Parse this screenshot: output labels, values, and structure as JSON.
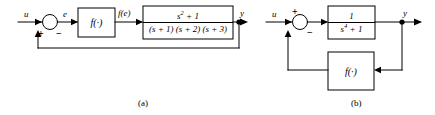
{
  "figure": {
    "background": "#ffffff",
    "line_color": "#000000"
  },
  "diagram_a": {
    "caption": "(a)",
    "input_label": "u",
    "error_label": "e",
    "nonlinearity_output_label": "f(e)",
    "output_label": "y",
    "summing_junction": {
      "name": "summing-junction",
      "positive_sign": "+",
      "negative_sign": "−"
    },
    "nonlinear_block": {
      "label": "f(·)"
    },
    "plant_block": {
      "numerator": "s",
      "numerator_exponent": "2",
      "numerator_tail": " + 1",
      "denominator": "(s + 1) (s + 2) (s + 3)"
    },
    "feedback_path": "unity"
  },
  "diagram_b": {
    "caption": "(b)",
    "input_label": "u",
    "output_label": "y",
    "summing_junction": {
      "name": "summing-junction",
      "positive_sign": "+",
      "negative_sign": "−"
    },
    "plant_block": {
      "numerator": "1",
      "denominator_base": "s",
      "denominator_exponent": "4",
      "denominator_tail": " + 1"
    },
    "feedback_block": {
      "label": "f(·)"
    }
  }
}
